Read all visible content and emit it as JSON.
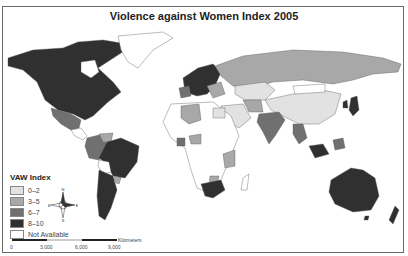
{
  "title": "Violence against Women Index 2005",
  "legend": {
    "title": "VAW Index",
    "items": [
      {
        "label": "0–2",
        "color": "#e2e2e2"
      },
      {
        "label": "3–5",
        "color": "#a8a8a8"
      },
      {
        "label": "6–7",
        "color": "#707070"
      },
      {
        "label": "8–10",
        "color": "#303030"
      },
      {
        "label": "Not Available",
        "color": "#ffffff"
      }
    ]
  },
  "scale_bar": {
    "unit": "Kilometers",
    "ticks": [
      "0",
      "3,000",
      "6,000",
      "9,000"
    ]
  },
  "compass": {
    "n": "N",
    "s": "S",
    "e": "E",
    "w": "W"
  },
  "regions": [
    {
      "name": "North America (US/Canada)",
      "class": "8-10"
    },
    {
      "name": "Mexico",
      "class": "6-7"
    },
    {
      "name": "Greenland",
      "class": "Not Available"
    },
    {
      "name": "Brazil",
      "class": "8-10"
    },
    {
      "name": "Argentina/Chile",
      "class": "8-10"
    },
    {
      "name": "Peru/Colombia",
      "class": "6-7"
    },
    {
      "name": "Northern Europe",
      "class": "8-10"
    },
    {
      "name": "Russia",
      "class": "3-5"
    },
    {
      "name": "China",
      "class": "0-2"
    },
    {
      "name": "Kazakhstan",
      "class": "0-2"
    },
    {
      "name": "India",
      "class": "6-7"
    },
    {
      "name": "Algeria",
      "class": "3-5"
    },
    {
      "name": "South Africa",
      "class": "8-10"
    },
    {
      "name": "Australia",
      "class": "8-10"
    },
    {
      "name": "New Zealand",
      "class": "8-10"
    },
    {
      "name": "Japan",
      "class": "8-10"
    }
  ]
}
